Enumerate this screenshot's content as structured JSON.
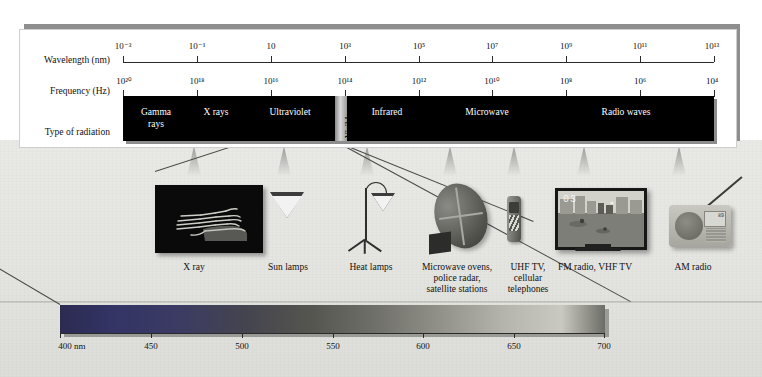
{
  "figure": {
    "row_labels": {
      "wavelength": "Wavelength (nm)",
      "frequency": "Frequency (Hz)",
      "type_of_radiation": "Type of radiation"
    },
    "wavelength_axis": {
      "unit": "nm",
      "ticks": [
        "10⁻³",
        "10⁻¹",
        "10",
        "10³",
        "10⁵",
        "10⁷",
        "10⁹",
        "10¹¹",
        "10¹³"
      ],
      "tick_values": [
        0.001,
        0.1,
        10,
        1000,
        100000,
        10000000,
        1000000000,
        100000000000,
        10000000000000
      ]
    },
    "frequency_axis": {
      "unit": "Hz",
      "ticks": [
        "10²⁰",
        "10¹⁸",
        "10¹⁶",
        "10¹⁴",
        "10¹²",
        "10¹⁰",
        "10⁸",
        "10⁶",
        "10⁴"
      ],
      "tick_values": [
        1e+20,
        1e+18,
        1e+16,
        100000000000000.0,
        1000000000000.0,
        10000000000.0,
        100000000.0,
        1000000.0,
        10000.0
      ]
    },
    "bands": [
      {
        "name": "Gamma rays",
        "label_line1": "Gamma",
        "label_line2": "rays"
      },
      {
        "name": "X rays",
        "label_line1": "X rays",
        "label_line2": ""
      },
      {
        "name": "Ultraviolet",
        "label_line1": "Ultraviolet",
        "label_line2": ""
      },
      {
        "name": "Visible",
        "label_line1": "Visible",
        "label_line2": ""
      },
      {
        "name": "Infrared",
        "label_line1": "Infrared",
        "label_line2": ""
      },
      {
        "name": "Microwave",
        "label_line1": "Microwave",
        "label_line2": ""
      },
      {
        "name": "Radio waves",
        "label_line1": "Radio waves",
        "label_line2": ""
      }
    ],
    "band_colors": {
      "bar_fill": "#000000",
      "bar_text": "#ffffff",
      "visible_band": "#d8d8d8",
      "card_background": "#ffffff",
      "scene_background": "#e6e6e3",
      "shadow": "#8e8e8e"
    },
    "applications": [
      {
        "id": "x-ray",
        "caption": "X ray",
        "device": "x-ray-photograph"
      },
      {
        "id": "sun-lamps",
        "caption": "Sun lamps",
        "device": "sun-lamp"
      },
      {
        "id": "heat-lamps",
        "caption": "Heat lamps",
        "device": "heat-lamp"
      },
      {
        "id": "microwave",
        "caption": "Microwave ovens,\npolice radar,\nsatellite stations",
        "device": "satellite-dish"
      },
      {
        "id": "uhf",
        "caption": "UHF TV,\ncellular\ntelephones",
        "device": "cellular-telephone"
      },
      {
        "id": "fm",
        "caption": "FM radio, VHF TV",
        "device": "television"
      },
      {
        "id": "am",
        "caption": "AM radio",
        "device": "am-radio"
      }
    ],
    "television": {
      "channel_display": "03"
    },
    "am_radio": {
      "display_text": "89"
    },
    "visible_spectrum": {
      "unit_label": "400 nm",
      "ticks": [
        "400 nm",
        "450",
        "500",
        "550",
        "600",
        "650",
        "700"
      ],
      "tick_values": [
        400,
        450,
        500,
        550,
        600,
        650,
        700
      ],
      "range_nm": [
        400,
        700
      ],
      "gradient_stops": [
        "#2b2b52",
        "#373771",
        "#3f3f5c",
        "#4a4a4a",
        "#6e6e68",
        "#9a9a92",
        "#c8c8c0",
        "#6a6a64"
      ]
    }
  }
}
